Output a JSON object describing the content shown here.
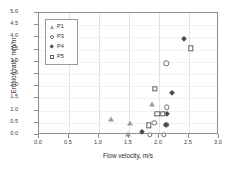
{
  "chart_data": {
    "type": "scatter",
    "title": "",
    "xlabel": "Flow velocity, m/s",
    "ylabel": "Erosion rate, mm/hr",
    "xlim": [
      0.0,
      3.0
    ],
    "ylim": [
      0.0,
      5.0
    ],
    "xticks": [
      "0.0",
      "0.5",
      "1.0",
      "1.5",
      "2.0",
      "2.5",
      "3.0"
    ],
    "yticks": [
      "0.0",
      "0.5",
      "1.0",
      "1.5",
      "2.0",
      "2.5",
      "3.0",
      "3.5",
      "4.0",
      "4.5",
      "5.0"
    ],
    "grid": "vertical-major",
    "legend_position": "upper-left-inside",
    "series": [
      {
        "name": "P1",
        "marker": "triangle-filled-gray",
        "color": "#9d9d9d",
        "points": [
          {
            "x": 1.2,
            "y": 0.66
          },
          {
            "x": 1.48,
            "y": 0.03
          },
          {
            "x": 1.52,
            "y": 0.49
          },
          {
            "x": 1.88,
            "y": 1.26
          }
        ]
      },
      {
        "name": "P3",
        "marker": "circle-open",
        "color": "#6f6f6f",
        "points": [
          {
            "x": 1.85,
            "y": 0.0
          },
          {
            "x": 2.08,
            "y": 0.0
          },
          {
            "x": 1.92,
            "y": 0.5
          },
          {
            "x": 2.12,
            "y": 0.43
          },
          {
            "x": 2.13,
            "y": 1.14
          },
          {
            "x": 2.12,
            "y": 2.94
          }
        ]
      },
      {
        "name": "P4",
        "marker": "diamond-filled",
        "color": "#4a4a4a",
        "points": [
          {
            "x": 1.72,
            "y": 0.12
          },
          {
            "x": 2.12,
            "y": 0.42
          },
          {
            "x": 2.14,
            "y": 0.86
          },
          {
            "x": 2.22,
            "y": 1.72
          },
          {
            "x": 2.42,
            "y": 3.92
          }
        ]
      },
      {
        "name": "P5",
        "marker": "square-open",
        "color": "#5d5d5d",
        "points": [
          {
            "x": 1.83,
            "y": 0.4
          },
          {
            "x": 1.97,
            "y": 0.86
          },
          {
            "x": 2.06,
            "y": 0.86
          },
          {
            "x": 1.93,
            "y": 1.89
          },
          {
            "x": 2.53,
            "y": 3.55
          }
        ]
      }
    ]
  },
  "legend": {
    "items": [
      {
        "label": "P1"
      },
      {
        "label": "P3"
      },
      {
        "label": "P4"
      },
      {
        "label": "P5"
      }
    ]
  }
}
